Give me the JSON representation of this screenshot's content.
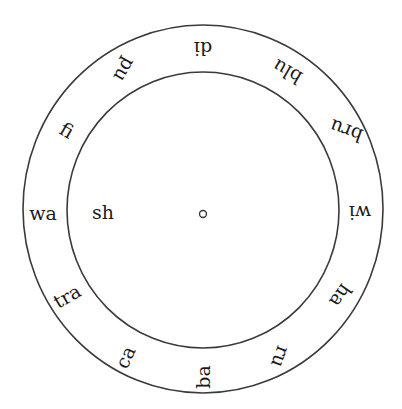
{
  "diagram": {
    "type": "syllable-wheel",
    "colors": {
      "stroke": "#3a3a3a",
      "text": "#1a1a1a",
      "background": "#ffffff"
    },
    "outer_circle": {
      "cx": 203,
      "cy": 209,
      "rx": 180,
      "ry": 184
    },
    "inner_circle": {
      "cx": 203,
      "cy": 210,
      "rx": 136,
      "ry": 138
    },
    "center_dot": {
      "cx": 203,
      "cy": 214,
      "r": 3.5
    },
    "inner_label": {
      "text": "sh",
      "x": 103,
      "y": 212
    },
    "ring_labels": [
      {
        "text": "di",
        "x": 203,
        "y": 49,
        "rotate": 180
      },
      {
        "text": "blu",
        "x": 287,
        "y": 72,
        "rotate": 210
      },
      {
        "text": "bru",
        "x": 346,
        "y": 131,
        "rotate": 200
      },
      {
        "text": "wi",
        "x": 360,
        "y": 213,
        "rotate": 180
      },
      {
        "text": "ha",
        "x": 341,
        "y": 296,
        "rotate": 125
      },
      {
        "text": "ru",
        "x": 281,
        "y": 357,
        "rotate": 110
      },
      {
        "text": "ba",
        "x": 203,
        "y": 377,
        "rotate": 270
      },
      {
        "text": "ca",
        "x": 125,
        "y": 357,
        "rotate": 295
      },
      {
        "text": "tra",
        "x": 67,
        "y": 296,
        "rotate": 330
      },
      {
        "text": "wa",
        "x": 43,
        "y": 213,
        "rotate": 0
      },
      {
        "text": "fi",
        "x": 67,
        "y": 130,
        "rotate": 30
      },
      {
        "text": "pu",
        "x": 125,
        "y": 70,
        "rotate": 120
      }
    ]
  }
}
